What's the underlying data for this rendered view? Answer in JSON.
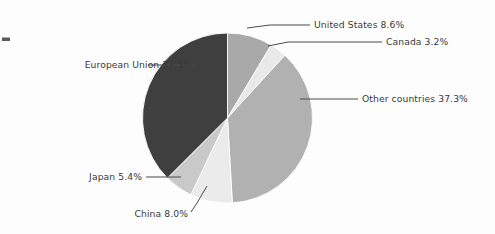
{
  "canvas": {
    "width": 495,
    "height": 234,
    "background": "#fdfdfd"
  },
  "marks": {
    "left_edge_dash": "–"
  },
  "chart_data": {
    "type": "pie",
    "title": "",
    "subtitle": "",
    "xlabel": "",
    "ylabel": "",
    "grid": false,
    "legend_position": "none",
    "label_format": "{name} {value}%",
    "start_angle_deg": 0,
    "direction": "clockwise",
    "categories": [
      "United States",
      "Canada",
      "Other countries",
      "China",
      "Japan",
      "European Union"
    ],
    "values": [
      8.6,
      3.2,
      37.3,
      8.0,
      5.4,
      37.5
    ],
    "colors": [
      "#a9a9a9",
      "#e9e9e9",
      "#b1b1b1",
      "#ebebeb",
      "#c9c9c9",
      "#3f3f3f"
    ],
    "labels": [
      "United States 8.6%",
      "Canada 3.2%",
      "Other countries 37.3%",
      "China 8.0%",
      "Japan 5.4%",
      "European Union 37.5%"
    ],
    "slices": [
      {
        "name": "United States",
        "value": 8.6,
        "label": "United States 8.6%",
        "color": "#a9a9a9"
      },
      {
        "name": "Canada",
        "value": 3.2,
        "label": "Canada 3.2%",
        "color": "#e9e9e9"
      },
      {
        "name": "Other countries",
        "value": 37.3,
        "label": "Other countries 37.3%",
        "color": "#b1b1b1"
      },
      {
        "name": "China",
        "value": 8.0,
        "label": "China 8.0%",
        "color": "#ebebeb"
      },
      {
        "name": "Japan",
        "value": 5.4,
        "label": "Japan 5.4%",
        "color": "#c9c9c9"
      },
      {
        "name": "European Union",
        "value": 37.5,
        "label": "European Union 37.5%",
        "color": "#3f3f3f"
      }
    ],
    "total": 100.0,
    "geometry": {
      "cx": 227.5,
      "cy": 118,
      "r": 85
    }
  },
  "text_color": "#3a3a3a",
  "leader_color": "#4a4a4a"
}
